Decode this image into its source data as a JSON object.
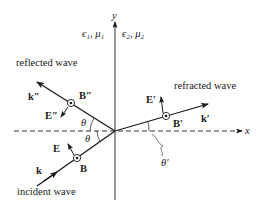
{
  "diagram": {
    "axes": {
      "x_label": "x",
      "y_label": "y"
    },
    "media": {
      "left": "ϵ₁, μ₁",
      "right": "ϵ₂, μ₂"
    },
    "waves": {
      "incident": {
        "label": "incident wave",
        "k_label": "k",
        "E_label": "E",
        "B_label": "B",
        "angle_label": "θ"
      },
      "reflected": {
        "label": "reflected wave",
        "k_label": "k″",
        "E_label": "E″",
        "B_label": "B″",
        "angle_label": "θ"
      },
      "refracted": {
        "label": "refracted wave",
        "k_label": "k′",
        "E_label": "E′",
        "B_label": "B′",
        "angle_label": "θ′"
      }
    },
    "colors": {
      "line": "#1a1a1a",
      "background": "#ffffff"
    }
  }
}
